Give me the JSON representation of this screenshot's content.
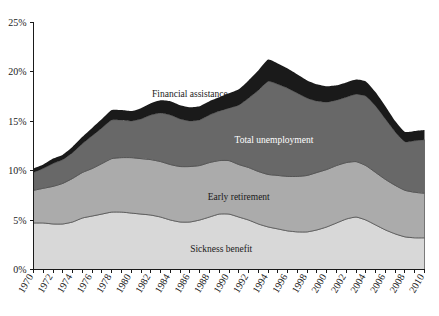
{
  "chart_data": {
    "type": "area",
    "stacked": true,
    "title": "",
    "subtitle": "",
    "xlabel": "",
    "ylabel": "",
    "xlim": [
      1970,
      2010
    ],
    "ylim": [
      0,
      25
    ],
    "grid": false,
    "legend_position": "inline-annotations",
    "y_tick_labels": [
      "0%",
      "5%",
      "10%",
      "15%",
      "20%",
      "25%"
    ],
    "y_tick_values": [
      0,
      5,
      10,
      15,
      20,
      25
    ],
    "x_tick_labels": [
      "1970",
      "1972",
      "1974",
      "1976",
      "1978",
      "1980",
      "1982",
      "1984",
      "1986",
      "1988",
      "1990",
      "1992",
      "1994",
      "1996",
      "1998",
      "2000",
      "2002",
      "2004",
      "2006",
      "2008",
      "2010"
    ],
    "x_tick_values": [
      1970,
      1972,
      1974,
      1976,
      1978,
      1980,
      1982,
      1984,
      1986,
      1988,
      1990,
      1992,
      1994,
      1996,
      1998,
      2000,
      2002,
      2004,
      2006,
      2008,
      2010
    ],
    "x_minor_ticks_every": 1,
    "x": [
      1970,
      1971,
      1972,
      1973,
      1974,
      1975,
      1976,
      1977,
      1978,
      1979,
      1980,
      1981,
      1982,
      1983,
      1984,
      1985,
      1986,
      1987,
      1988,
      1989,
      1990,
      1991,
      1992,
      1993,
      1994,
      1995,
      1996,
      1997,
      1998,
      1999,
      2000,
      2001,
      2002,
      2003,
      2004,
      2005,
      2006,
      2007,
      2008,
      2009,
      2010
    ],
    "series": [
      {
        "name": "Sickness benefit",
        "color": "#d8d8d8",
        "label_color": "#1a1a1a",
        "values": [
          4.7,
          4.7,
          4.6,
          4.6,
          4.8,
          5.2,
          5.4,
          5.6,
          5.8,
          5.8,
          5.7,
          5.6,
          5.5,
          5.3,
          5.0,
          4.8,
          4.8,
          5.0,
          5.3,
          5.6,
          5.6,
          5.3,
          5.0,
          4.6,
          4.3,
          4.1,
          3.9,
          3.8,
          3.8,
          4.0,
          4.3,
          4.7,
          5.1,
          5.3,
          5.0,
          4.5,
          4.0,
          3.6,
          3.3,
          3.2,
          3.2
        ]
      },
      {
        "name": "Early retirement",
        "color": "#ababab",
        "label_color": "#1a1a1a",
        "values": [
          3.3,
          3.5,
          3.8,
          4.1,
          4.4,
          4.6,
          4.8,
          5.1,
          5.4,
          5.5,
          5.6,
          5.6,
          5.6,
          5.6,
          5.6,
          5.6,
          5.6,
          5.5,
          5.5,
          5.4,
          5.4,
          5.3,
          5.3,
          5.3,
          5.3,
          5.4,
          5.5,
          5.6,
          5.7,
          5.8,
          5.8,
          5.8,
          5.7,
          5.6,
          5.5,
          5.3,
          5.1,
          4.9,
          4.7,
          4.6,
          4.5
        ]
      },
      {
        "name": "Total unemployment",
        "color": "#686868",
        "label_color": "#ffffff",
        "values": [
          1.8,
          2.0,
          2.3,
          2.4,
          2.6,
          2.9,
          3.3,
          3.6,
          3.9,
          3.8,
          3.7,
          4.0,
          4.5,
          4.9,
          5.0,
          4.8,
          4.6,
          4.6,
          4.8,
          5.0,
          5.3,
          6.0,
          7.0,
          8.2,
          9.4,
          9.2,
          8.9,
          8.4,
          7.8,
          7.2,
          6.8,
          6.6,
          6.6,
          6.8,
          7.0,
          6.7,
          6.1,
          5.4,
          4.9,
          5.2,
          5.4
        ]
      },
      {
        "name": "Financial assistance",
        "color": "#1a1a1a",
        "label_color": "#1a1a1a",
        "values": [
          0.4,
          0.4,
          0.5,
          0.5,
          0.6,
          0.7,
          0.8,
          0.9,
          1.0,
          1.0,
          1.0,
          1.1,
          1.2,
          1.3,
          1.4,
          1.4,
          1.4,
          1.4,
          1.4,
          1.4,
          1.5,
          1.6,
          1.8,
          2.0,
          2.2,
          2.1,
          2.0,
          1.9,
          1.8,
          1.7,
          1.6,
          1.5,
          1.5,
          1.5,
          1.5,
          1.4,
          1.3,
          1.1,
          1.0,
          1.0,
          1.0
        ]
      }
    ],
    "annotations": [
      {
        "text": "Financial assistance",
        "x": 1986.0,
        "y": 17.4,
        "on": "light"
      },
      {
        "text": "Total unemployment",
        "x": 1994.6,
        "y": 12.8,
        "on": "dark"
      },
      {
        "text": "Early retirement",
        "x": 1991.0,
        "y": 7.0,
        "on": "light"
      },
      {
        "text": "Sickness benefit",
        "x": 1989.2,
        "y": 1.8,
        "on": "light"
      }
    ]
  }
}
